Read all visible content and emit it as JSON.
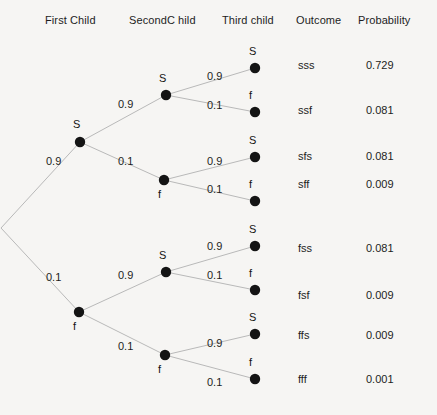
{
  "headers": [
    {
      "label": "First Child",
      "x": 45,
      "y": 14
    },
    {
      "label": "SecondC hild",
      "x": 129,
      "y": 14
    },
    {
      "label": "Third child",
      "x": 222,
      "y": 14
    },
    {
      "label": "Outcome",
      "x": 296,
      "y": 14
    },
    {
      "label": "Probability",
      "x": 358,
      "y": 14
    }
  ],
  "chart_data": {
    "type": "diagram",
    "subtype": "probability-tree",
    "levels": [
      "First Child",
      "SecondC hild",
      "Third child"
    ],
    "branch_probabilities": {
      "S": 0.9,
      "f": 0.1
    },
    "outcomes": [
      "sss",
      "ssf",
      "sfs",
      "sff",
      "fss",
      "fsf",
      "ffs",
      "fff"
    ],
    "probabilities": [
      0.729,
      0.081,
      0.081,
      0.009,
      0.081,
      0.009,
      0.009,
      0.001
    ],
    "outcome_labels": [
      "sss",
      "ssf",
      "sfs",
      "sff",
      "fss",
      "fsf",
      "ffs",
      "fff"
    ],
    "probability_labels": [
      "0.729",
      "0.081",
      "0.081",
      "0.009",
      "0.081",
      "0.009",
      "0.009",
      "0.001"
    ],
    "edge_label_values": [
      "0.9",
      "0.1"
    ],
    "node_outcome_symbols": [
      "S",
      "f"
    ]
  },
  "root": {
    "x": 1,
    "y": 228
  },
  "nodes_level1": [
    {
      "id": "n-s",
      "symbol": "S",
      "x": 80,
      "y": 142,
      "label_x": 73,
      "label_y": 118
    },
    {
      "id": "n-f",
      "symbol": "f",
      "x": 79,
      "y": 312,
      "label_x": 73,
      "label_y": 320
    }
  ],
  "nodes_level2": [
    {
      "id": "n-ss",
      "symbol": "S",
      "x": 166,
      "y": 95,
      "label_x": 159,
      "label_y": 72
    },
    {
      "id": "n-sf",
      "symbol": "f",
      "x": 164,
      "y": 180,
      "label_x": 158,
      "label_y": 188
    },
    {
      "id": "n-fs",
      "symbol": "S",
      "x": 166,
      "y": 272,
      "label_x": 159,
      "label_y": 249
    },
    {
      "id": "n-ff",
      "symbol": "f",
      "x": 165,
      "y": 355,
      "label_x": 158,
      "label_y": 363
    }
  ],
  "nodes_level3": [
    {
      "id": "n-sss",
      "symbol": "S",
      "x": 255,
      "y": 68,
      "label_x": 249,
      "label_y": 45
    },
    {
      "id": "n-ssf",
      "symbol": "f",
      "x": 255,
      "y": 112,
      "label_x": 249,
      "label_y": 89
    },
    {
      "id": "n-sfs",
      "symbol": "S",
      "x": 255,
      "y": 157,
      "label_x": 249,
      "label_y": 134
    },
    {
      "id": "n-sff",
      "symbol": "f",
      "x": 255,
      "y": 201,
      "label_x": 249,
      "label_y": 178
    },
    {
      "id": "n-fss",
      "symbol": "S",
      "x": 255,
      "y": 246,
      "label_x": 249,
      "label_y": 223
    },
    {
      "id": "n-fsf",
      "symbol": "f",
      "x": 255,
      "y": 290,
      "label_x": 249,
      "label_y": 267
    },
    {
      "id": "n-ffs",
      "symbol": "S",
      "x": 255,
      "y": 334,
      "label_x": 249,
      "label_y": 311
    },
    {
      "id": "n-fff",
      "symbol": "f",
      "x": 255,
      "y": 379,
      "label_x": 249,
      "label_y": 356
    }
  ],
  "edges": [
    {
      "id": "e-root-s",
      "x1": 1,
      "y1": 228,
      "x2": 80,
      "y2": 142
    },
    {
      "id": "e-root-f",
      "x1": 1,
      "y1": 228,
      "x2": 79,
      "y2": 312
    },
    {
      "id": "e-s-ss",
      "x1": 80,
      "y1": 142,
      "x2": 166,
      "y2": 95
    },
    {
      "id": "e-s-sf",
      "x1": 80,
      "y1": 142,
      "x2": 164,
      "y2": 180
    },
    {
      "id": "e-f-fs",
      "x1": 79,
      "y1": 312,
      "x2": 166,
      "y2": 272
    },
    {
      "id": "e-f-ff",
      "x1": 79,
      "y1": 312,
      "x2": 165,
      "y2": 355
    },
    {
      "id": "e-ss-sss",
      "x1": 166,
      "y1": 95,
      "x2": 255,
      "y2": 68
    },
    {
      "id": "e-ss-ssf",
      "x1": 166,
      "y1": 95,
      "x2": 255,
      "y2": 112
    },
    {
      "id": "e-sf-sfs",
      "x1": 164,
      "y1": 180,
      "x2": 255,
      "y2": 157
    },
    {
      "id": "e-sf-sff",
      "x1": 164,
      "y1": 180,
      "x2": 255,
      "y2": 201
    },
    {
      "id": "e-fs-fss",
      "x1": 166,
      "y1": 272,
      "x2": 255,
      "y2": 246
    },
    {
      "id": "e-fs-fsf",
      "x1": 166,
      "y1": 272,
      "x2": 255,
      "y2": 290
    },
    {
      "id": "e-ff-ffs",
      "x1": 165,
      "y1": 355,
      "x2": 255,
      "y2": 334
    },
    {
      "id": "e-ff-fff",
      "x1": 165,
      "y1": 355,
      "x2": 255,
      "y2": 379
    }
  ],
  "edge_labels": [
    {
      "id": "el-root-s",
      "value": "0.9",
      "x": 46,
      "y": 155
    },
    {
      "id": "el-root-f",
      "value": "0.1",
      "x": 46,
      "y": 271
    },
    {
      "id": "el-s-ss",
      "value": "0.9",
      "x": 118,
      "y": 98
    },
    {
      "id": "el-s-sf",
      "value": "0.1",
      "x": 118,
      "y": 155
    },
    {
      "id": "el-f-fs",
      "value": "0.9",
      "x": 118,
      "y": 269
    },
    {
      "id": "el-f-ff",
      "value": "0.1",
      "x": 118,
      "y": 340
    },
    {
      "id": "el-ss-sss",
      "value": "0.9",
      "x": 207,
      "y": 70
    },
    {
      "id": "el-ss-ssf",
      "value": "0.1",
      "x": 207,
      "y": 99
    },
    {
      "id": "el-sf-sfs",
      "value": "0.9",
      "x": 207,
      "y": 155
    },
    {
      "id": "el-sf-sff",
      "value": "0.1",
      "x": 207,
      "y": 183
    },
    {
      "id": "el-fs-fss",
      "value": "0.9",
      "x": 207,
      "y": 240
    },
    {
      "id": "el-fs-fsf",
      "value": "0.1",
      "x": 207,
      "y": 269
    },
    {
      "id": "el-ff-ffs",
      "value": "0.9",
      "x": 207,
      "y": 337
    },
    {
      "id": "el-ff-fff",
      "value": "0.1",
      "x": 207,
      "y": 376
    }
  ],
  "rows": [
    {
      "outcome": "sss",
      "probability": "0.729",
      "y": 59
    },
    {
      "outcome": "ssf",
      "probability": "0.081",
      "y": 104
    },
    {
      "outcome": "sfs",
      "probability": "0.081",
      "y": 150
    },
    {
      "outcome": "sff",
      "probability": "0.009",
      "y": 178
    },
    {
      "outcome": "fss",
      "probability": "0.081",
      "y": 242
    },
    {
      "outcome": "fsf",
      "probability": "0.009",
      "y": 289
    },
    {
      "outcome": "ffs",
      "probability": "0.009",
      "y": 329
    },
    {
      "outcome": "fff",
      "probability": "0.001",
      "y": 373
    }
  ],
  "columns": {
    "outcome_x": 298,
    "probability_x": 366
  },
  "style": {
    "background": "#f6f5f3",
    "edge_color": "#b9b9b9",
    "node_color": "#141414",
    "text_color": "#1d1d1d"
  }
}
